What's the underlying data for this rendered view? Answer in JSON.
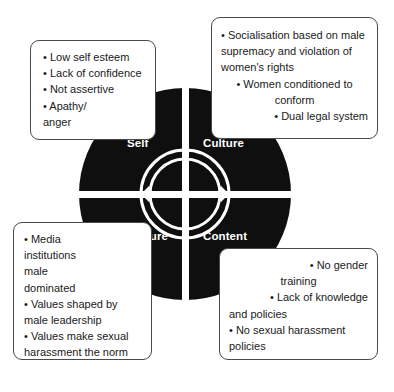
{
  "diagram": {
    "center": {
      "icon": "circular-arrow-ring-icon",
      "description": "Concentric circular arrow ring at the hub of the wheel"
    },
    "colors": {
      "disc": "#100f0f",
      "divider": "#ffffff",
      "label_text": "#ffffff",
      "box_border": "#4a4a4a",
      "box_background": "#ffffff",
      "body_text": "#1a1a1a"
    },
    "quadrants": [
      {
        "key": "self",
        "label": "Self"
      },
      {
        "key": "culture",
        "label": "Culture"
      },
      {
        "key": "structure",
        "label": "Structure"
      },
      {
        "key": "content",
        "label": "Content"
      }
    ],
    "boxes": {
      "self": {
        "items": [
          "Low self esteem",
          "Lack of confidence",
          "Not assertive",
          "Apathy/ anger"
        ],
        "lines": [
          {
            "bullet": true,
            "text": "Low self esteem",
            "align": "left"
          },
          {
            "bullet": true,
            "text": "Lack of confidence",
            "align": "left"
          },
          {
            "bullet": true,
            "text": "Not assertive",
            "align": "left"
          },
          {
            "bullet": true,
            "text": "Apathy/",
            "align": "left"
          },
          {
            "bullet": false,
            "text": "anger",
            "align": "left"
          }
        ]
      },
      "culture": {
        "items": [
          "Socialisation based on male supremacy and violation of women's rights",
          "Women conditioned to conform",
          "Dual legal system"
        ],
        "lines": [
          {
            "bullet": true,
            "text": "Socialisation based on male",
            "align": "left"
          },
          {
            "bullet": false,
            "text": "supremacy and violation of",
            "align": "left"
          },
          {
            "bullet": false,
            "text": "women's rights",
            "align": "left"
          },
          {
            "bullet": true,
            "text": "Women conditioned to",
            "align": "center"
          },
          {
            "bullet": false,
            "text": "conform",
            "align": "center"
          },
          {
            "bullet": true,
            "text": "Dual legal system",
            "align": "right"
          }
        ]
      },
      "structure": {
        "items": [
          "Media institutions male dominated",
          "Values shaped by male leadership",
          "Values make sexual harassment the norm"
        ],
        "lines": [
          {
            "bullet": true,
            "text": "Media",
            "align": "left"
          },
          {
            "bullet": false,
            "text": "institutions",
            "align": "left"
          },
          {
            "bullet": false,
            "text": "male",
            "align": "left"
          },
          {
            "bullet": false,
            "text": "dominated",
            "align": "left"
          },
          {
            "bullet": true,
            "text": "Values shaped by",
            "align": "left"
          },
          {
            "bullet": false,
            "text": "male leadership",
            "align": "left"
          },
          {
            "bullet": true,
            "text": "Values make sexual",
            "align": "left"
          },
          {
            "bullet": false,
            "text": "harassment the norm",
            "align": "left"
          }
        ]
      },
      "content": {
        "items": [
          "No gender training",
          "Lack of knowledge and policies",
          "No sexual harassment policies"
        ],
        "lines": [
          {
            "bullet": true,
            "text": "No gender",
            "align": "right"
          },
          {
            "bullet": false,
            "text": "training",
            "align": "center"
          },
          {
            "bullet": true,
            "text": "Lack of knowledge",
            "align": "right"
          },
          {
            "bullet": false,
            "text": "and policies",
            "align": "left"
          },
          {
            "bullet": true,
            "text": "No sexual harassment",
            "align": "left"
          },
          {
            "bullet": false,
            "text": "policies",
            "align": "left"
          }
        ]
      }
    }
  }
}
